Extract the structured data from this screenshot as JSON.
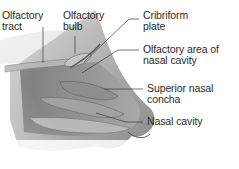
{
  "diagram": {
    "labels": [
      {
        "id": "olfactory-tract",
        "line1": "Olfactory",
        "line2": "tract"
      },
      {
        "id": "olfactory-bulb",
        "line1": "Olfactory",
        "line2": "bulb"
      },
      {
        "id": "cribriform-plate",
        "line1": "Cribriform",
        "line2": "plate"
      },
      {
        "id": "olfactory-area",
        "line1": "Olfactory area of",
        "line2": "nasal cavity"
      },
      {
        "id": "superior-nasal-concha",
        "line1": "Superior nasal",
        "line2": "concha"
      },
      {
        "id": "nasal-cavity",
        "line1": "Nasal cavity",
        "line2": ""
      }
    ],
    "colors": {
      "text": "#2a2a2a",
      "leader_line": "#3a3a3a",
      "tissue_dark": "#6e6e6e",
      "tissue_mid": "#9a9a9a",
      "tissue_light": "#c8c8c8",
      "background": "#ffffff"
    }
  }
}
